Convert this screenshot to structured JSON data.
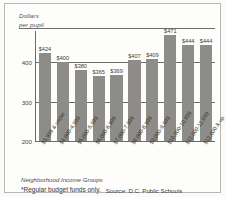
{
  "figure": {
    "y_axis_title_line1": "Dollars",
    "y_axis_title_line2": "per pupil",
    "x_axis_title": "Neighborhood Income Groups",
    "footnote": "*Regular budget funds only.",
    "source": "Source: D.C. Public Schools",
    "bar_color": "#8d8c88",
    "axis_color": "#6e6c68"
  },
  "chart_data": {
    "type": "bar",
    "title": "",
    "subtitle": "",
    "xlabel": "Neighborhood Income Groups",
    "ylabel": "Dollars per pupil",
    "ylim": [
      200,
      480
    ],
    "yticks": [
      400,
      300,
      200
    ],
    "ytick_labels": [
      "400",
      "300",
      "200"
    ],
    "grid": true,
    "legend": false,
    "categories": [
      "$3,999 & under",
      "$4,000-4,999",
      "$5,000-5,999",
      "$6,000-6,999",
      "$7,000-7,999",
      "$8,000-8,999",
      "$9,000-9,999",
      "$10,000-10,999",
      "$11,000-11,999",
      "$12,000 & up"
    ],
    "values": [
      424,
      400,
      380,
      365,
      369,
      407,
      409,
      471,
      444,
      444
    ],
    "value_labels": [
      "$424",
      "$400",
      "$380",
      "$365",
      "$369",
      "$407",
      "$409",
      "$471",
      "$444",
      "$444"
    ],
    "annotations": [
      "*Regular budget funds only.",
      "Source: D.C. Public Schools"
    ]
  }
}
